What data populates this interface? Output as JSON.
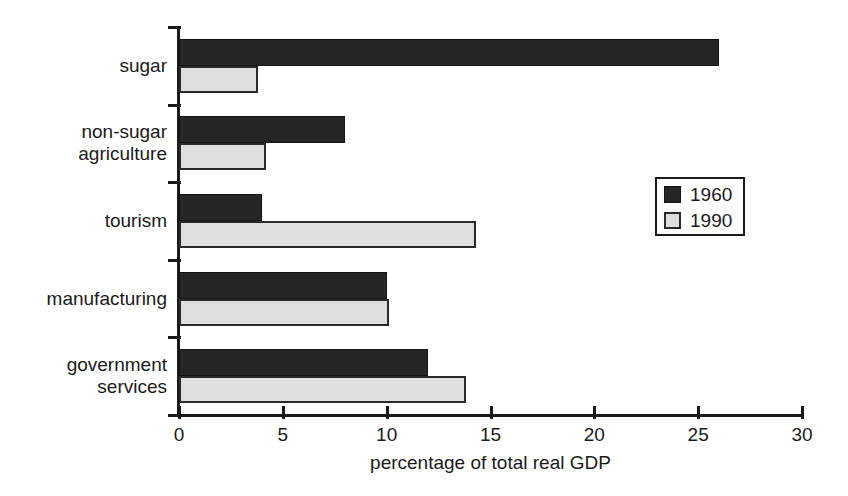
{
  "chart_data": {
    "type": "bar",
    "orientation": "horizontal",
    "title": "",
    "xlabel": "percentage of total real GDP",
    "ylabel": "",
    "categories": [
      "sugar",
      "non-sugar\nagriculture",
      "tourism",
      "manufacturing",
      "government\nservices"
    ],
    "series": [
      {
        "name": "1960",
        "color": "#262626",
        "values": [
          26.0,
          8.0,
          4.0,
          10.0,
          12.0
        ]
      },
      {
        "name": "1990",
        "color": "#dededc",
        "values": [
          3.8,
          4.2,
          14.3,
          10.1,
          13.8
        ]
      }
    ],
    "xlim": [
      0,
      30
    ],
    "xticks": [
      0,
      5,
      10,
      15,
      20,
      25,
      30
    ],
    "xtick_labels": [
      "0",
      "5",
      "10",
      "15",
      "20",
      "25",
      "30"
    ],
    "grid": false,
    "legend_position": "right-middle"
  },
  "legend": {
    "entries": [
      {
        "label": "1960",
        "swatch": "dark-swatch"
      },
      {
        "label": "1990",
        "swatch": "light-swatch"
      }
    ]
  }
}
